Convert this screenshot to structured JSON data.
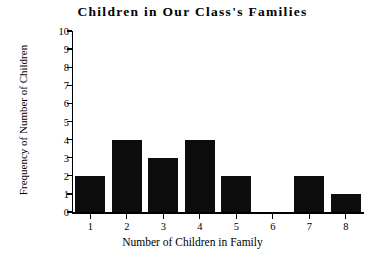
{
  "chart_data": {
    "type": "bar",
    "title": "Children in Our Class's Families",
    "xlabel": "Number of Children in Family",
    "ylabel": "Frequency of Number of Children",
    "categories": [
      "1",
      "2",
      "3",
      "4",
      "5",
      "6",
      "7",
      "8"
    ],
    "values": [
      2,
      4,
      3,
      4,
      2,
      0,
      2,
      1
    ],
    "ylim": [
      0,
      10
    ],
    "ytick_labels": [
      "10",
      "9",
      "8",
      "7",
      "6",
      "5",
      "4",
      "3",
      "2",
      "1",
      "0"
    ],
    "ytick_values": [
      10,
      9,
      8,
      7,
      6,
      5,
      4,
      3,
      2,
      1,
      0
    ],
    "xlim": [
      0.5,
      8.5
    ],
    "grid": false,
    "legend": false,
    "bar_color": "#0d0d0d",
    "background_color": "#ffffff",
    "axis_color": "#000000"
  }
}
